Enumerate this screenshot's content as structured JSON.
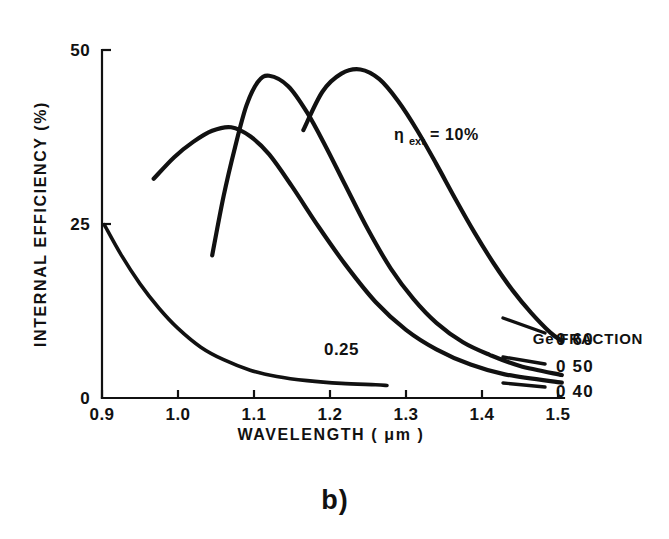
{
  "figure": {
    "caption": "b)",
    "background": "#ffffff",
    "ink_color": "#111111"
  },
  "chart_data": {
    "type": "line",
    "title": "",
    "xlabel": "WAVELENGTH ( μm )",
    "ylabel": "INTERNAL EFFICIENCY (%)",
    "xlim": [
      0.9,
      1.5
    ],
    "ylim": [
      0,
      50
    ],
    "grid": false,
    "xticks": [
      0.9,
      1.0,
      1.1,
      1.2,
      1.3,
      1.4,
      1.5
    ],
    "xticklabels": [
      "0.9",
      "1.0",
      "1.1",
      "1.2",
      "1.3",
      "1.4",
      "1.5"
    ],
    "yticks": [
      0,
      25,
      50
    ],
    "yticklabels": [
      "0",
      "25",
      "50"
    ],
    "legend_position": "right",
    "legend_title": "Ge FRACTION",
    "annotations": [
      {
        "text": "η",
        "sub": "ext",
        "tail": " = 10%",
        "x": 1.31,
        "y": 35.5
      },
      {
        "text": "0.25",
        "x": 1.215,
        "y": 6.2
      }
    ],
    "series": [
      {
        "name": "0.60",
        "legend_label": "0 60",
        "ge_fraction": 0.6,
        "x": [
          1.165,
          1.19,
          1.215,
          1.24,
          1.265,
          1.29,
          1.315,
          1.34,
          1.365,
          1.39,
          1.415,
          1.44,
          1.465,
          1.49,
          1.505
        ],
        "y": [
          38.5,
          44.0,
          46.6,
          47.2,
          45.8,
          42.6,
          38.4,
          33.6,
          28.6,
          23.8,
          19.4,
          15.5,
          12.2,
          9.4,
          8.2
        ]
      },
      {
        "name": "0.50",
        "legend_label": "0 50",
        "ge_fraction": 0.5,
        "x": [
          1.045,
          1.06,
          1.075,
          1.09,
          1.105,
          1.12,
          1.145,
          1.17,
          1.195,
          1.22,
          1.25,
          1.28,
          1.31,
          1.34,
          1.375,
          1.41,
          1.45,
          1.505
        ],
        "y": [
          20.5,
          29.0,
          36.0,
          42.0,
          45.4,
          46.3,
          44.8,
          41.0,
          36.0,
          30.6,
          24.2,
          18.6,
          14.2,
          10.8,
          8.0,
          6.2,
          4.6,
          3.3
        ]
      },
      {
        "name": "0.40",
        "legend_label": "0 40",
        "ge_fraction": 0.4,
        "x": [
          0.968,
          0.995,
          1.02,
          1.045,
          1.07,
          1.095,
          1.12,
          1.15,
          1.185,
          1.22,
          1.26,
          1.3,
          1.34,
          1.385,
          1.43,
          1.505
        ],
        "y": [
          31.5,
          34.6,
          36.8,
          38.4,
          38.9,
          37.6,
          35.0,
          30.4,
          24.6,
          19.2,
          13.8,
          9.8,
          7.0,
          4.8,
          3.4,
          2.2
        ]
      },
      {
        "name": "0.25",
        "legend_label": "0.25",
        "ge_fraction": 0.25,
        "inline_labeled": true,
        "x": [
          0.903,
          0.925,
          0.95,
          0.975,
          1.0,
          1.03,
          1.06,
          1.095,
          1.13,
          1.17,
          1.215,
          1.26,
          1.275
        ],
        "y": [
          24.9,
          20.6,
          16.4,
          12.9,
          10.0,
          7.3,
          5.5,
          4.0,
          3.1,
          2.5,
          2.1,
          1.9,
          1.8
        ]
      }
    ]
  }
}
